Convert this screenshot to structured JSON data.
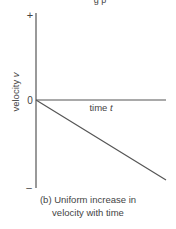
{
  "figure": {
    "top_cut_text": "g  p",
    "y_axis": {
      "label": "velocity",
      "label_symbol": "v",
      "top_tick": "+",
      "zero_tick": "0",
      "bottom_tick": "–"
    },
    "x_axis": {
      "label": "time",
      "label_symbol": "t"
    },
    "line": {
      "description": "straight line from origin sloping downward",
      "start": {
        "t": 0,
        "v": 0
      },
      "end": {
        "t": 1,
        "v": -0.93
      }
    },
    "caption": {
      "line1": "(b) Uniform increase in",
      "line2": "velocity with time"
    },
    "colors": {
      "axis": "#555555",
      "line": "#555555",
      "text": "#444444"
    }
  }
}
